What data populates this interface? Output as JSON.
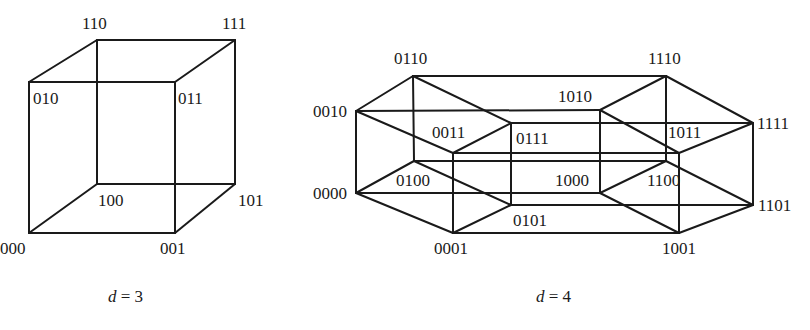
{
  "diagrams": [
    {
      "id": "d3",
      "caption": {
        "var": "d",
        "eq": " = ",
        "value": "3",
        "x": 108,
        "y": 302
      },
      "vertices": {
        "000": {
          "x": 29,
          "y": 233,
          "lx": 0,
          "ly": 254
        },
        "001": {
          "x": 175,
          "y": 233,
          "lx": 160,
          "ly": 254
        },
        "010": {
          "x": 29,
          "y": 82,
          "lx": 33,
          "ly": 104
        },
        "011": {
          "x": 175,
          "y": 82,
          "lx": 178,
          "ly": 104
        },
        "100": {
          "x": 97,
          "y": 184,
          "lx": 98,
          "ly": 206
        },
        "101": {
          "x": 235,
          "y": 184,
          "lx": 238,
          "ly": 206
        },
        "110": {
          "x": 97,
          "y": 40,
          "lx": 82,
          "ly": 29
        },
        "111": {
          "x": 235,
          "y": 40,
          "lx": 222,
          "ly": 29
        }
      },
      "edges": [
        [
          "000",
          "001"
        ],
        [
          "000",
          "010"
        ],
        [
          "000",
          "100"
        ],
        [
          "001",
          "011"
        ],
        [
          "001",
          "101"
        ],
        [
          "010",
          "011"
        ],
        [
          "010",
          "110"
        ],
        [
          "011",
          "111"
        ],
        [
          "100",
          "101"
        ],
        [
          "100",
          "110"
        ],
        [
          "101",
          "111"
        ],
        [
          "110",
          "111"
        ]
      ]
    },
    {
      "id": "d4",
      "caption": {
        "var": "d",
        "eq": " = ",
        "value": "4",
        "x": 536,
        "y": 302
      },
      "vertices": {
        "0000": {
          "x": 356,
          "y": 193,
          "lx": 313,
          "ly": 199
        },
        "0001": {
          "x": 453,
          "y": 233,
          "lx": 434,
          "ly": 254
        },
        "0010": {
          "x": 356,
          "y": 111,
          "lx": 313,
          "ly": 117
        },
        "0011": {
          "x": 453,
          "y": 153,
          "lx": 432,
          "ly": 138
        },
        "0100": {
          "x": 414,
          "y": 161,
          "lx": 396,
          "ly": 186
        },
        "0101": {
          "x": 511,
          "y": 205,
          "lx": 513,
          "ly": 226
        },
        "0110": {
          "x": 413,
          "y": 76,
          "lx": 394,
          "ly": 64
        },
        "0111": {
          "x": 511,
          "y": 123,
          "lx": 516,
          "ly": 144
        },
        "1000": {
          "x": 600,
          "y": 193,
          "lx": 555,
          "ly": 186
        },
        "1001": {
          "x": 679,
          "y": 233,
          "lx": 662,
          "ly": 254
        },
        "1010": {
          "x": 600,
          "y": 110,
          "lx": 558,
          "ly": 102
        },
        "1011": {
          "x": 679,
          "y": 153,
          "lx": 668,
          "ly": 138
        },
        "1100": {
          "x": 666,
          "y": 161,
          "lx": 647,
          "ly": 186
        },
        "1101": {
          "x": 753,
          "y": 205,
          "lx": 758,
          "ly": 211
        },
        "1110": {
          "x": 666,
          "y": 76,
          "lx": 648,
          "ly": 64
        },
        "1111": {
          "x": 753,
          "y": 123,
          "lx": 757,
          "ly": 129
        }
      },
      "edges": [
        [
          "0000",
          "0001"
        ],
        [
          "0000",
          "0010"
        ],
        [
          "0000",
          "0100"
        ],
        [
          "0001",
          "0011"
        ],
        [
          "0001",
          "0101"
        ],
        [
          "0010",
          "0011"
        ],
        [
          "0010",
          "0110"
        ],
        [
          "0011",
          "0111"
        ],
        [
          "0100",
          "0101"
        ],
        [
          "0100",
          "0110"
        ],
        [
          "0101",
          "0111"
        ],
        [
          "0110",
          "0111"
        ],
        [
          "1000",
          "1001"
        ],
        [
          "1000",
          "1010"
        ],
        [
          "1000",
          "1100"
        ],
        [
          "1001",
          "1011"
        ],
        [
          "1001",
          "1101"
        ],
        [
          "1010",
          "1011"
        ],
        [
          "1010",
          "1110"
        ],
        [
          "1011",
          "1111"
        ],
        [
          "1100",
          "1101"
        ],
        [
          "1100",
          "1110"
        ],
        [
          "1101",
          "1111"
        ],
        [
          "1110",
          "1111"
        ],
        [
          "0000",
          "1000"
        ],
        [
          "0001",
          "1001"
        ],
        [
          "0010",
          "1010"
        ],
        [
          "0011",
          "1011"
        ],
        [
          "0100",
          "1100"
        ],
        [
          "0101",
          "1101"
        ],
        [
          "0110",
          "1110"
        ],
        [
          "0111",
          "1111"
        ]
      ]
    }
  ],
  "colors": {
    "line": "#1a1a1a",
    "background": "#ffffff"
  }
}
